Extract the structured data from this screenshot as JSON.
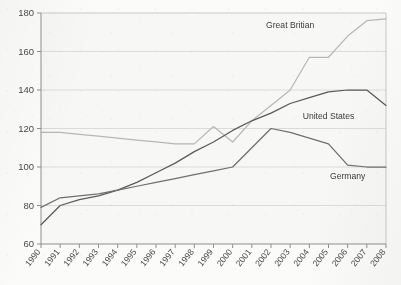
{
  "chart_data": {
    "type": "line",
    "title": "",
    "subtitle": "",
    "xlabel": "",
    "ylabel": "",
    "ylim": [
      60,
      180
    ],
    "ytick_labels": [
      "60",
      "80",
      "100",
      "120",
      "140",
      "160",
      "180"
    ],
    "ytick_values": [
      60,
      80,
      100,
      120,
      140,
      160,
      180
    ],
    "grid": true,
    "legend_position": "inline-labels",
    "x": [
      1990,
      1991,
      1992,
      1993,
      1994,
      1995,
      1996,
      1997,
      1998,
      1999,
      2000,
      2001,
      2002,
      2003,
      2004,
      2005,
      2006,
      2007,
      2008
    ],
    "categories": [
      "1990",
      "1991",
      "1992",
      "1993",
      "1994",
      "1995",
      "1996",
      "1997",
      "1998",
      "1999",
      "2000",
      "2001",
      "2002",
      "2003",
      "2004",
      "2005",
      "2006",
      "2007",
      "2008"
    ],
    "series": [
      {
        "name": "Great Britian",
        "color": "#b7b7b7",
        "values": [
          118,
          118,
          117,
          116,
          115,
          114,
          113,
          112,
          112,
          121,
          113,
          124,
          132,
          140,
          157,
          157,
          168,
          176,
          177
        ]
      },
      {
        "name": "United States",
        "color": "#5a5a5a",
        "values": [
          70,
          80,
          83,
          85,
          88,
          92,
          97,
          102,
          108,
          113,
          119,
          124,
          128,
          133,
          136,
          139,
          140,
          140,
          132
        ]
      },
      {
        "name": "Germany",
        "color": "#6f6f6f",
        "values": [
          79,
          84,
          85,
          86,
          88,
          90,
          92,
          94,
          96,
          98,
          100,
          110,
          120,
          118,
          115,
          112,
          101,
          100,
          100
        ]
      }
    ],
    "annotations": [
      {
        "text": "Great Britian",
        "x": 2003,
        "y": 172
      },
      {
        "text": "United States",
        "x": 2005,
        "y": 125
      },
      {
        "text": "Germany",
        "x": 2006,
        "y": 94
      }
    ]
  }
}
